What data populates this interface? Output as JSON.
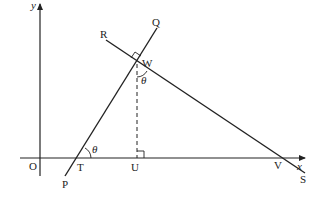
{
  "diagram": {
    "type": "geometry",
    "axes": {
      "x_label": "x",
      "y_label": "y",
      "origin_label": "O"
    },
    "points": {
      "O": "O",
      "T": "T",
      "U": "U",
      "V": "V",
      "W": "W",
      "P": "P",
      "Q": "Q",
      "R": "R",
      "S": "S"
    },
    "angle_label": "θ",
    "lines": [
      {
        "name": "PQ",
        "from": "P",
        "to": "Q"
      },
      {
        "name": "RS",
        "from": "R",
        "to": "S"
      },
      {
        "name": "WU",
        "from": "W",
        "to": "U",
        "style": "dashed"
      }
    ],
    "right_angles": [
      "W (between PQ and RS)",
      "U (between WU and x-axis)"
    ],
    "angles": [
      "θ at T between x-axis and TQ",
      "θ at W between WU and WS"
    ],
    "colors": {
      "line": "#222222",
      "background": "#ffffff"
    }
  }
}
